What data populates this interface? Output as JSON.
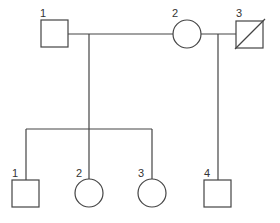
{
  "diagram": {
    "type": "pedigree",
    "colors": {
      "line": "#444444",
      "background": "#ffffff",
      "text": "#333333"
    },
    "generation_1": [
      {
        "id": "I-1",
        "label": "1",
        "sex": "male",
        "shape": "square",
        "deceased": false
      },
      {
        "id": "I-2",
        "label": "2",
        "sex": "female",
        "shape": "circle",
        "deceased": false
      },
      {
        "id": "I-3",
        "label": "3",
        "sex": "male",
        "shape": "square",
        "deceased": true
      }
    ],
    "generation_2": [
      {
        "id": "II-1",
        "label": "1",
        "sex": "male",
        "shape": "square",
        "parents": [
          "I-1",
          "I-2"
        ]
      },
      {
        "id": "II-2",
        "label": "2",
        "sex": "female",
        "shape": "circle",
        "parents": [
          "I-1",
          "I-2"
        ]
      },
      {
        "id": "II-3",
        "label": "3",
        "sex": "female",
        "shape": "circle",
        "parents": [
          "I-1",
          "I-2"
        ]
      },
      {
        "id": "II-4",
        "label": "4",
        "sex": "male",
        "shape": "square",
        "parents": [
          "I-2",
          "I-3"
        ]
      }
    ],
    "unions": [
      {
        "partners": [
          "I-1",
          "I-2"
        ],
        "children": [
          "II-1",
          "II-2",
          "II-3"
        ]
      },
      {
        "partners": [
          "I-2",
          "I-3"
        ],
        "children": [
          "II-4"
        ]
      }
    ]
  }
}
